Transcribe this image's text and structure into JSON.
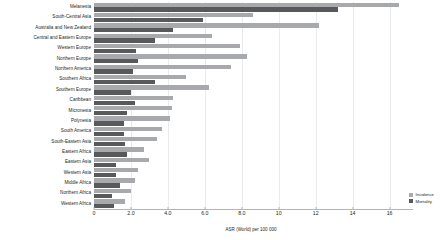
{
  "chart_data": {
    "type": "bar",
    "orientation": "horizontal",
    "grouped": true,
    "title": "",
    "xlabel": "ASR (World) per 100 000",
    "ylabel": "",
    "xlim": [
      0,
      17
    ],
    "grid": true,
    "legend_position": "bottom-right",
    "categories": [
      "Melanesia",
      "South-Central Asia",
      "Australia and New Zealand",
      "Central and Eastern Europe",
      "Western Europe",
      "Northern Europe",
      "Northern America",
      "Southern Africa",
      "Southern Europe",
      "Caribbean",
      "Micronesia",
      "Polynesia",
      "South America",
      "South-Eastern Asia",
      "Eastern Africa",
      "Eastern Asia",
      "Western Asia",
      "Middle Africa",
      "Northern Africa",
      "Western Africa"
    ],
    "series": [
      {
        "name": "Incidence",
        "color": "#a7a9ac",
        "values": [
          16.5,
          8.6,
          12.2,
          6.4,
          7.9,
          8.3,
          7.4,
          5.0,
          6.2,
          4.3,
          4.2,
          4.1,
          3.7,
          3.4,
          2.7,
          3.0,
          2.4,
          2.2,
          2.0,
          1.7
        ]
      },
      {
        "name": "Mortality",
        "color": "#58595b",
        "values": [
          13.2,
          5.9,
          4.3,
          3.3,
          2.3,
          2.4,
          2.1,
          3.3,
          2.0,
          2.2,
          1.8,
          1.6,
          1.6,
          1.7,
          1.8,
          1.2,
          1.2,
          1.4,
          1.0,
          1.1
        ]
      }
    ],
    "xticks": [
      {
        "value": 0,
        "label": "0"
      },
      {
        "value": 2,
        "label": "2.0"
      },
      {
        "value": 4,
        "label": "4.0"
      },
      {
        "value": 6,
        "label": "6.0"
      },
      {
        "value": 8,
        "label": "8.0"
      },
      {
        "value": 10,
        "label": "10"
      },
      {
        "value": 12,
        "label": "12"
      },
      {
        "value": 14,
        "label": "14"
      },
      {
        "value": 16,
        "label": "16"
      }
    ]
  },
  "legend": {
    "items": [
      {
        "label": "Incidence",
        "color": "#a7a9ac"
      },
      {
        "label": "Mortality",
        "color": "#58595b"
      }
    ]
  }
}
